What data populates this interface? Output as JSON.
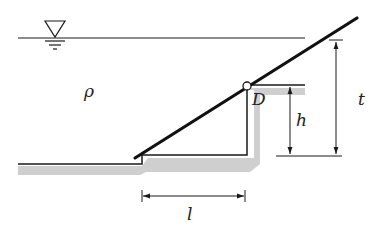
{
  "diagram": {
    "type": "hydrostatic-gate",
    "labels": {
      "density": "ρ",
      "hinge": "D",
      "height_h": "h",
      "depth_t": "t",
      "length_l": "l"
    },
    "colors": {
      "line": "#1a1a1a",
      "shading": "#cfcfcf",
      "background": "#ffffff"
    },
    "symbols": {
      "free_surface": "water-level-triangle"
    }
  }
}
